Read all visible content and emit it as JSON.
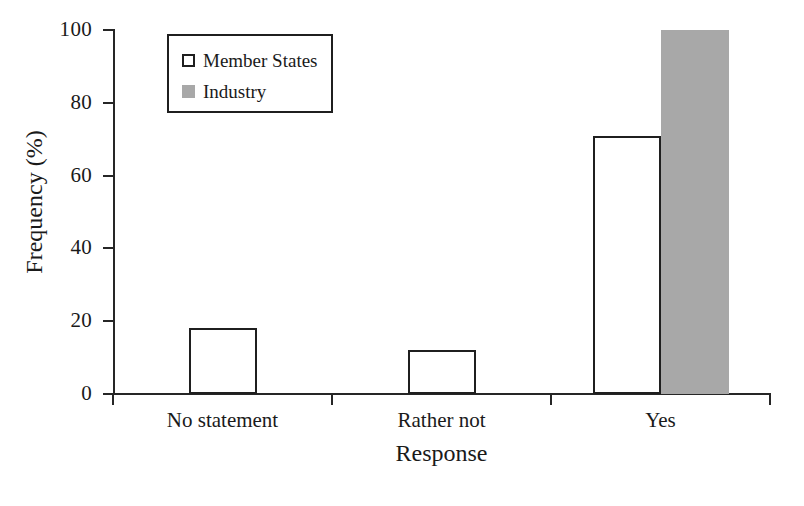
{
  "chart_data": {
    "type": "bar",
    "title": "",
    "xlabel": "Response",
    "ylabel": "Frequency (%)",
    "categories": [
      "No statement",
      "Rather not",
      "Yes"
    ],
    "series": [
      {
        "name": "Member States",
        "values": [
          18,
          12,
          71
        ],
        "fill": "#ffffff",
        "edge": "#1f1f1f"
      },
      {
        "name": "Industry",
        "values": [
          0,
          0,
          100
        ],
        "fill": "#a8a8a8",
        "edge": "#a8a8a8"
      }
    ],
    "ylim": [
      0,
      100
    ],
    "yticks": [
      0,
      20,
      40,
      60,
      80,
      100
    ],
    "ytick_labels": [
      "0",
      "20",
      "40",
      "60",
      "80",
      "100"
    ],
    "grid": false,
    "legend_position": "upper left"
  },
  "axes": {
    "y_title": "Frequency (%)",
    "x_title": "Response"
  },
  "legend": {
    "entries": [
      {
        "label": "Member States",
        "swatch": "open-square-swatch"
      },
      {
        "label": "Industry",
        "swatch": "filled-gray-square-swatch"
      }
    ]
  },
  "colors": {
    "industry_gray": "#a8a8a8",
    "line_black": "#1f1f1f",
    "background": "#ffffff"
  }
}
